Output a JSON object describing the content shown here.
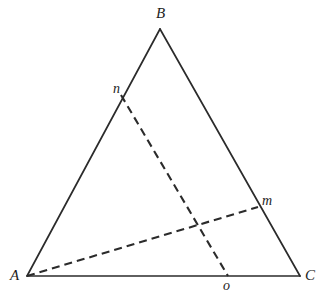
{
  "figure": {
    "background_color": "#ffffff",
    "line_color": "#2b2b2b",
    "width": 327,
    "height": 301,
    "points": {
      "A": {
        "label": "A",
        "x": 27,
        "y": 276,
        "label_x": 10,
        "label_y": 268
      },
      "B": {
        "label": "B",
        "x": 160,
        "y": 29,
        "label_x": 156,
        "label_y": 6
      },
      "C": {
        "label": "C",
        "x": 300,
        "y": 276,
        "label_x": 305,
        "label_y": 268
      },
      "m": {
        "label": "m",
        "x": 258,
        "y": 207,
        "label_x": 262,
        "label_y": 194
      },
      "n": {
        "label": "n",
        "x": 121,
        "y": 95,
        "label_x": 113,
        "label_y": 82
      },
      "o": {
        "label": "o",
        "x": 228,
        "y": 276,
        "label_x": 223,
        "label_y": 279
      }
    },
    "solid_edges": [
      {
        "name": "edge-ab",
        "from": "A",
        "to": "B"
      },
      {
        "name": "edge-bc",
        "from": "B",
        "to": "C"
      },
      {
        "name": "edge-ac",
        "from": "A",
        "to": "C"
      }
    ],
    "dashed_segments": [
      {
        "name": "cevian-a-m",
        "from": "A",
        "to": "m"
      },
      {
        "name": "cevian-n-o",
        "from": "n",
        "to": "o"
      }
    ],
    "path_data": {
      "edge_ab": "M 27 276 L 160 29",
      "edge_bc": "M 160 29 L 300 276",
      "edge_ac": "M 27 276 L 300 276",
      "cevian_a_m": "M 27 276 L 258 207",
      "cevian_n_o": "M 121 95 L 228 276"
    }
  }
}
